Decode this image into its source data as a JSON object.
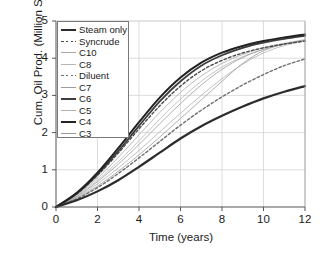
{
  "chart": {
    "title": "",
    "xlabel": "Time (years)",
    "ylabel": "Cum. Oil Prod. (Million STB)"
  },
  "axes": {
    "x_ticks": [
      "0",
      "2",
      "4",
      "6",
      "8",
      "10",
      "12"
    ],
    "y_ticks": [
      "0",
      "1",
      "2",
      "3",
      "4",
      "5"
    ]
  },
  "legend": {
    "position": "upper-left",
    "items": [
      {
        "label": "Steam only",
        "style": "solid",
        "width": 2.2,
        "color": "#2b2b2b"
      },
      {
        "label": "Syncrude",
        "style": "dashed",
        "width": 1.4,
        "color": "#4a4a4a"
      },
      {
        "label": "C10",
        "style": "solid",
        "width": 0.8,
        "color": "#a8a8a8"
      },
      {
        "label": "C8",
        "style": "solid",
        "width": 0.8,
        "color": "#b5b5b5"
      },
      {
        "label": "Diluent",
        "style": "dashed",
        "width": 1.4,
        "color": "#6e6e6e"
      },
      {
        "label": "C7",
        "style": "solid",
        "width": 0.8,
        "color": "#9c9c9c"
      },
      {
        "label": "C6",
        "style": "solid",
        "width": 1.8,
        "color": "#3d3d3d"
      },
      {
        "label": "C5",
        "style": "solid",
        "width": 0.8,
        "color": "#b0b0b0"
      },
      {
        "label": "C4",
        "style": "solid",
        "width": 2.0,
        "color": "#222222"
      },
      {
        "label": "C3",
        "style": "solid",
        "width": 0.8,
        "color": "#9a9a9a"
      }
    ]
  },
  "chart_data": {
    "type": "line",
    "title": "",
    "xlabel": "Time (years)",
    "ylabel": "Cum. Oil Prod. (Million STB)",
    "xlim": [
      0,
      12
    ],
    "ylim": [
      0,
      5
    ],
    "xticks": [
      0,
      2,
      4,
      6,
      8,
      10,
      12
    ],
    "yticks": [
      0,
      1,
      2,
      3,
      4,
      5
    ],
    "grid": true,
    "legend_position": "upper-left",
    "x": [
      0,
      1,
      2,
      3,
      4,
      5,
      6,
      7,
      8,
      9,
      10,
      11,
      12
    ],
    "series": [
      {
        "name": "Steam only",
        "style": "solid",
        "color": "#2b2b2b",
        "width": 2.2,
        "values": [
          0.0,
          0.18,
          0.42,
          0.72,
          1.08,
          1.46,
          1.84,
          2.17,
          2.45,
          2.7,
          2.92,
          3.1,
          3.25
        ]
      },
      {
        "name": "Syncrude",
        "style": "dashed",
        "color": "#4a4a4a",
        "width": 1.4,
        "values": [
          0.0,
          0.35,
          0.85,
          1.45,
          2.1,
          2.72,
          3.25,
          3.66,
          3.94,
          4.14,
          4.28,
          4.38,
          4.46
        ]
      },
      {
        "name": "C10",
        "style": "solid",
        "color": "#a8a8a8",
        "width": 0.8,
        "values": [
          0.0,
          0.32,
          0.78,
          1.33,
          1.94,
          2.54,
          3.08,
          3.52,
          3.86,
          4.1,
          4.28,
          4.4,
          4.5
        ]
      },
      {
        "name": "C8",
        "style": "solid",
        "color": "#b5b5b5",
        "width": 0.8,
        "values": [
          0.0,
          0.3,
          0.72,
          1.22,
          1.78,
          2.36,
          2.9,
          3.38,
          3.76,
          4.04,
          4.24,
          4.38,
          4.48
        ]
      },
      {
        "name": "Diluent",
        "style": "dashed",
        "color": "#6e6e6e",
        "width": 1.4,
        "values": [
          0.0,
          0.22,
          0.52,
          0.9,
          1.32,
          1.76,
          2.2,
          2.6,
          2.96,
          3.28,
          3.56,
          3.8,
          3.98
        ]
      },
      {
        "name": "C7",
        "style": "solid",
        "color": "#9c9c9c",
        "width": 0.8,
        "values": [
          0.0,
          0.28,
          0.68,
          1.15,
          1.68,
          2.24,
          2.78,
          3.28,
          3.7,
          4.02,
          4.24,
          4.38,
          4.48
        ]
      },
      {
        "name": "C6",
        "style": "solid",
        "color": "#3d3d3d",
        "width": 1.8,
        "values": [
          0.0,
          0.36,
          0.88,
          1.5,
          2.18,
          2.84,
          3.38,
          3.8,
          4.08,
          4.28,
          4.42,
          4.52,
          4.6
        ]
      },
      {
        "name": "C5",
        "style": "solid",
        "color": "#b0b0b0",
        "width": 0.8,
        "values": [
          0.0,
          0.26,
          0.62,
          1.05,
          1.52,
          2.02,
          2.52,
          3.0,
          3.45,
          3.84,
          4.14,
          4.34,
          4.46
        ]
      },
      {
        "name": "C4",
        "style": "solid",
        "color": "#222222",
        "width": 2.0,
        "values": [
          0.0,
          0.38,
          0.92,
          1.58,
          2.28,
          2.94,
          3.48,
          3.88,
          4.15,
          4.33,
          4.46,
          4.56,
          4.64
        ]
      },
      {
        "name": "C3",
        "style": "solid",
        "color": "#9a9a9a",
        "width": 0.8,
        "values": [
          0.0,
          0.24,
          0.56,
          0.96,
          1.4,
          1.88,
          2.38,
          2.88,
          3.38,
          3.86,
          4.2,
          4.38,
          4.48
        ]
      }
    ]
  }
}
